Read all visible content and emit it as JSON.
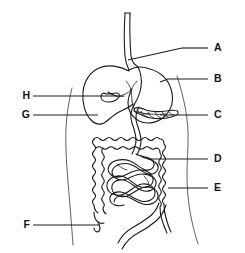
{
  "figure": {
    "background_color": "#ffffff",
    "stroke_color": "#1a1a1a",
    "width": 245,
    "height": 253
  },
  "labels": [
    {
      "id": "A",
      "text": "A",
      "side": "right",
      "text_x": 214,
      "text_y": 48,
      "line_x1": 182,
      "line_y1": 48,
      "line_x2": 208,
      "line_y2": 48,
      "target_x": 124,
      "target_y": 60,
      "organ": "esophagus"
    },
    {
      "id": "B",
      "text": "B",
      "side": "right",
      "text_x": 214,
      "text_y": 79,
      "line_x1": 168,
      "line_y1": 79,
      "line_x2": 208,
      "line_y2": 79,
      "target_x": 160,
      "target_y": 82,
      "organ": "stomach"
    },
    {
      "id": "C",
      "text": "C",
      "side": "right",
      "text_x": 214,
      "text_y": 115,
      "line_x1": 160,
      "line_y1": 115,
      "line_x2": 208,
      "line_y2": 115,
      "target_x": 150,
      "target_y": 116,
      "organ": "pancreas"
    },
    {
      "id": "D",
      "text": "D",
      "side": "right",
      "text_x": 214,
      "text_y": 159,
      "line_x1": 148,
      "line_y1": 159,
      "line_x2": 208,
      "line_y2": 159,
      "target_x": 140,
      "target_y": 160,
      "organ": "small-intestine"
    },
    {
      "id": "E",
      "text": "E",
      "side": "right",
      "text_x": 214,
      "text_y": 188,
      "line_x1": 168,
      "line_y1": 188,
      "line_x2": 208,
      "line_y2": 188,
      "target_x": 166,
      "target_y": 188,
      "organ": "large-intestine"
    },
    {
      "id": "F",
      "text": "F",
      "side": "left",
      "text_x": 26,
      "text_y": 225,
      "line_x1": 33,
      "line_y1": 225,
      "line_x2": 100,
      "line_y2": 225,
      "target_x": 100,
      "target_y": 225,
      "organ": "appendix"
    },
    {
      "id": "G",
      "text": "G",
      "side": "left",
      "text_x": 26,
      "text_y": 115,
      "line_x1": 33,
      "line_y1": 115,
      "line_x2": 98,
      "line_y2": 115,
      "target_x": 98,
      "target_y": 115,
      "organ": "liver"
    },
    {
      "id": "H",
      "text": "H",
      "side": "left",
      "text_x": 26,
      "text_y": 96,
      "line_x1": 33,
      "line_y1": 96,
      "line_x2": 118,
      "line_y2": 96,
      "target_x": 118,
      "target_y": 96,
      "organ": "gallbladder"
    }
  ],
  "organs": [
    {
      "name": "esophagus",
      "label_id": "A"
    },
    {
      "name": "stomach",
      "label_id": "B"
    },
    {
      "name": "pancreas",
      "label_id": "C"
    },
    {
      "name": "small-intestine",
      "label_id": "D"
    },
    {
      "name": "large-intestine",
      "label_id": "E"
    },
    {
      "name": "appendix",
      "label_id": "F"
    },
    {
      "name": "liver",
      "label_id": "G"
    },
    {
      "name": "gallbladder",
      "label_id": "H"
    },
    {
      "name": "body-outline",
      "label_id": ""
    }
  ]
}
